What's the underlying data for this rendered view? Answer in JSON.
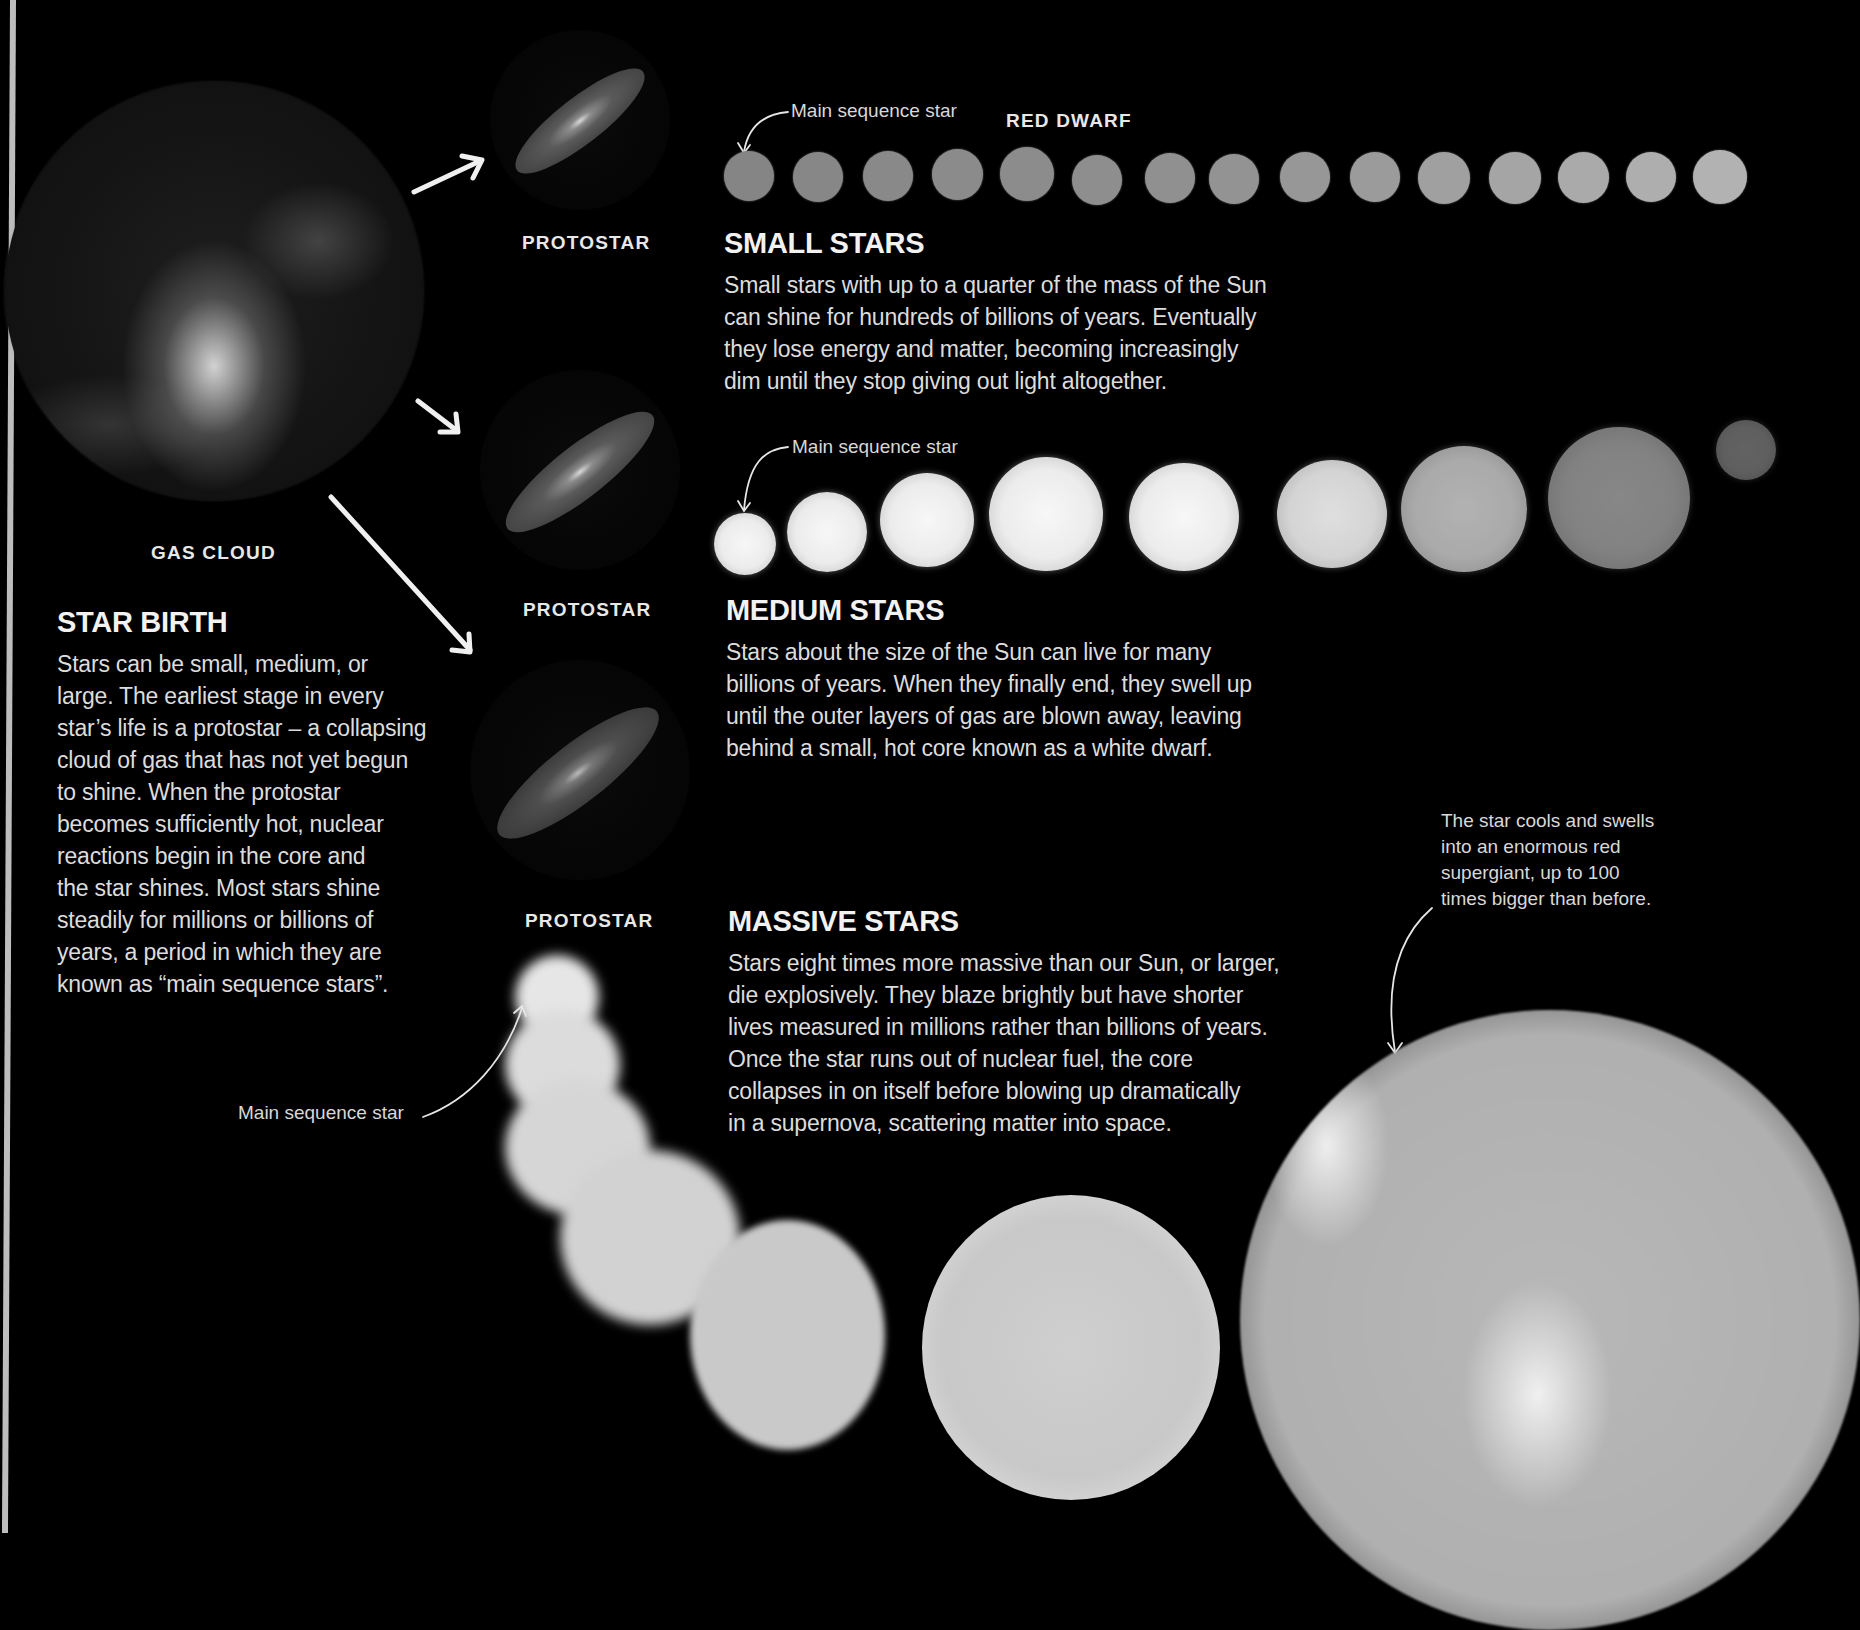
{
  "star_birth": {
    "gas_cloud_label": "GAS CLOUD",
    "heading": "STAR BIRTH",
    "body_lines": [
      "Stars can be small, medium, or",
      "large. The earliest stage in every",
      "star’s life is a protostar – a collapsing",
      "cloud of gas that has not yet begun",
      "to shine. When the protostar",
      "becomes sufficiently hot, nuclear",
      "reactions begin in the core and",
      "the star shines. Most stars shine",
      "steadily for millions or billions of",
      "years, a period in which they are",
      "known as “main sequence stars”."
    ]
  },
  "protostars": [
    {
      "label": "PROTOSTAR"
    },
    {
      "label": "PROTOSTAR"
    },
    {
      "label": "PROTOSTAR"
    }
  ],
  "small_stars": {
    "main_sequence_label": "Main sequence star",
    "red_dwarf_label": "RED DWARF",
    "heading": "SMALL STARS",
    "body_lines": [
      "Small stars with up to a quarter of the mass of the Sun",
      "can shine for hundreds of billions of years. Eventually",
      "they lose energy and matter, becoming increasingly",
      "dim until they stop giving out light altogether."
    ],
    "dot_count": 15
  },
  "medium_stars": {
    "main_sequence_label": "Main sequence star",
    "heading": "MEDIUM STARS",
    "body_lines": [
      "Stars about the size of the Sun can live for many",
      "billions of years. When they finally end, they swell up",
      "until the outer layers of gas are blown away, leaving",
      "behind a small, hot core known as a white dwarf."
    ]
  },
  "massive_stars": {
    "heading": "MASSIVE STARS",
    "body_lines": [
      "Stars eight times more massive than our Sun, or larger,",
      "die explosively. They blaze brightly but have shorter",
      "lives measured in millions rather than billions of years.",
      "Once the star runs out of nuclear fuel, the core",
      "collapses in on itself before blowing up dramatically",
      "in a supernova, scattering matter into space."
    ],
    "main_sequence_label": "Main sequence star",
    "supergiant_note_lines": [
      "The star cools and swells",
      "into an enormous red",
      "supergiant, up to 100",
      "times bigger than before."
    ]
  },
  "colors": {
    "background": "#000000",
    "text": "#e6e6e6",
    "small_star_fill": "#8f8f8f",
    "medium_star_fill": "#f2f2f2"
  }
}
